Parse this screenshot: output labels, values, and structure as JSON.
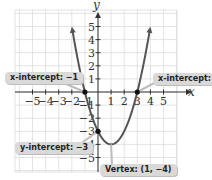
{
  "chart_data": {
    "type": "line",
    "title": "",
    "xlabel": "x",
    "ylabel": "y",
    "function": "y = x^2 - 2x - 3",
    "xlim": [
      -5,
      5
    ],
    "ylim": [
      -5,
      5
    ],
    "grid": true,
    "x_ticks": [
      -5,
      -4,
      -3,
      -2,
      -1,
      1,
      2,
      3,
      4,
      5
    ],
    "y_ticks": [
      -5,
      -4,
      -3,
      -2,
      -1,
      1,
      2,
      3,
      4,
      5
    ],
    "x_tick_labels": [
      "−5",
      "−4",
      "−3",
      "−2",
      "−1",
      "1",
      "2",
      "3",
      "4",
      "5"
    ],
    "y_tick_labels": [
      "−5",
      "−4",
      "−3",
      "−2",
      "−1",
      "1",
      "2",
      "3",
      "4",
      "5"
    ],
    "series": [
      {
        "name": "parabola",
        "x": [
          -2,
          -1.5,
          -1,
          -0.5,
          0,
          0.5,
          1,
          1.5,
          2,
          2.5,
          3,
          3.5,
          4
        ],
        "y": [
          5,
          2.25,
          0,
          -1.75,
          -3,
          -3.75,
          -4,
          -3.75,
          -3,
          -1.75,
          0,
          2.25,
          5
        ]
      }
    ],
    "points": [
      {
        "name": "x-intercept-left",
        "x": -1,
        "y": 0
      },
      {
        "name": "x-intercept-right",
        "x": 3,
        "y": 0
      },
      {
        "name": "y-intercept",
        "x": 0,
        "y": -3
      },
      {
        "name": "vertex",
        "x": 1,
        "y": -4
      }
    ],
    "annotations": [
      {
        "text": "x-intercept: −1",
        "target": [
          -1,
          0
        ]
      },
      {
        "text": "x-intercept: 3",
        "target": [
          3,
          0
        ]
      },
      {
        "text": "y-intercept: −3",
        "target": [
          0,
          -3
        ]
      },
      {
        "text": "Vertex: (1, −4)",
        "target": [
          1,
          -4
        ]
      }
    ]
  },
  "labels": {
    "x_axis": "x",
    "y_axis": "y",
    "x_intercept_left": "x-intercept: −1",
    "x_intercept_right": "x-intercept: 3",
    "y_intercept": "y-intercept: −3",
    "vertex": "Vertex: (1, −4)"
  },
  "colors": {
    "curve": "#555555",
    "axis": "#333333",
    "grid": "#d8d8d8",
    "callout_bg": "#d9d9d9",
    "point": "#111111"
  }
}
